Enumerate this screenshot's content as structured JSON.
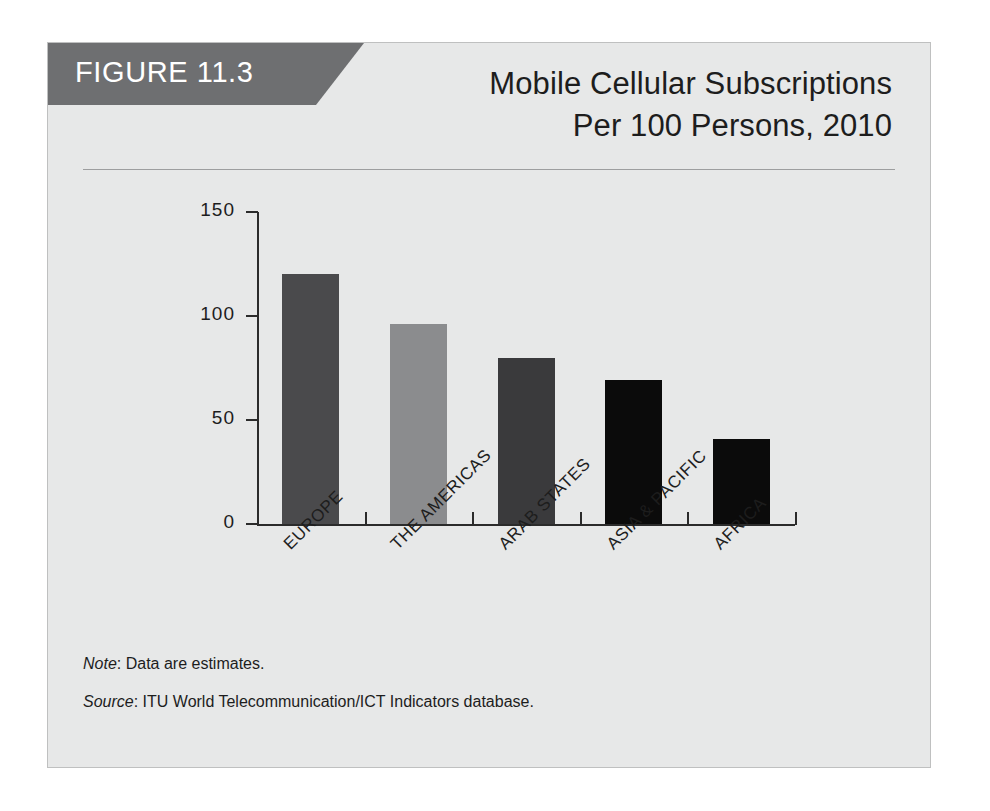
{
  "figure": {
    "label": "FIGURE 11.3",
    "ribbon_color": "#6e6f71",
    "panel_background": "#e7e8e8",
    "panel_border_color": "#bfc0c0"
  },
  "title": {
    "line1": "Mobile Cellular Subscriptions",
    "line2": "Per 100 Persons, 2010"
  },
  "footnotes": {
    "note_label": "Note",
    "note_text": ": Data are estimates.",
    "source_label": "Source",
    "source_text": ": ITU World Telecommunication/ICT Indicators database."
  },
  "chart_data": {
    "type": "bar",
    "title": "Mobile Cellular Subscriptions Per 100 Persons, 2010",
    "xlabel": "",
    "ylabel": "",
    "ylim": [
      0,
      150
    ],
    "yticks": [
      0,
      50,
      100,
      150
    ],
    "ytick_labels": [
      "0",
      "50",
      "100",
      "150"
    ],
    "grid": false,
    "legend": "none",
    "categories": [
      "EUROPE",
      "THE AMERICAS",
      "ARAB STATES",
      "ASIA & PACIFIC",
      "AFRICA"
    ],
    "values": [
      120,
      96,
      80,
      69,
      41
    ],
    "bar_colors": [
      "#4a4a4c",
      "#8b8c8e",
      "#3a3a3c",
      "#0b0b0b",
      "#0b0b0b"
    ],
    "note": "Data are estimates.",
    "source": "ITU World Telecommunication/ICT Indicators database."
  }
}
